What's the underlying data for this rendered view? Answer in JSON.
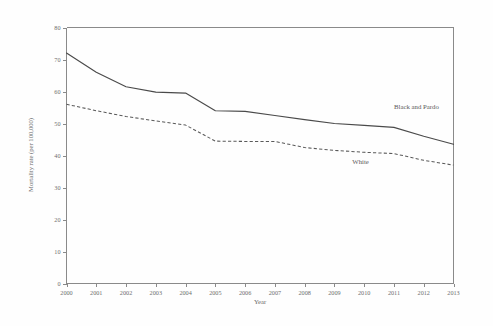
{
  "chart_data": {
    "type": "line",
    "title": "",
    "xlabel": "Year",
    "ylabel": "Mortality rate (per 100,000)",
    "x": [
      2000,
      2001,
      2002,
      2003,
      2004,
      2005,
      2006,
      2007,
      2008,
      2009,
      2010,
      2011,
      2012,
      2013
    ],
    "categories": [
      "2000",
      "2001",
      "2002",
      "2003",
      "2004",
      "2005",
      "2006",
      "2007",
      "2008",
      "2009",
      "2010",
      "2011",
      "2012",
      "2013"
    ],
    "series": [
      {
        "name": "Black and Pardo",
        "style": "solid",
        "color": "#4a4a4a",
        "values": [
          72.0,
          66.0,
          61.5,
          59.8,
          59.5,
          54.0,
          53.8,
          52.5,
          51.2,
          50.0,
          49.4,
          48.8,
          46.0,
          43.5
        ]
      },
      {
        "name": "White",
        "style": "dashed",
        "color": "#5a5a5a",
        "values": [
          56.0,
          54.0,
          52.2,
          50.8,
          49.5,
          44.5,
          44.4,
          44.4,
          42.5,
          41.6,
          41.0,
          40.6,
          38.5,
          37.0
        ]
      }
    ],
    "xlim": [
      2000,
      2013
    ],
    "ylim": [
      0,
      80
    ],
    "yticks": [
      0,
      10,
      20,
      30,
      40,
      50,
      60,
      70,
      80
    ],
    "ytick_labels": [
      "0",
      "10",
      "20",
      "30",
      "40",
      "50",
      "60",
      "70",
      "80"
    ],
    "grid": false,
    "legend": "inline-annotations",
    "annotations": [
      {
        "text": "Black and Pardo",
        "x": 2011.0,
        "y": 54.5
      },
      {
        "text": "White",
        "x": 2009.6,
        "y": 37.5
      }
    ]
  }
}
